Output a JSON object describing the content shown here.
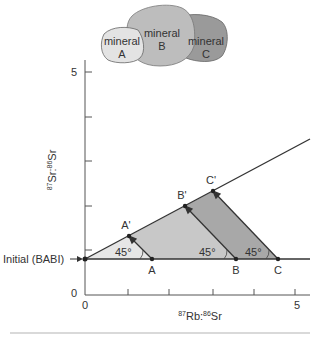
{
  "minerals": [
    {
      "name": "mineral",
      "id": "A",
      "fill": "#e3e3e3"
    },
    {
      "name": "mineral",
      "id": "B",
      "fill": "#bdbdbd"
    },
    {
      "name": "mineral",
      "id": "C",
      "fill": "#9a9a9a"
    }
  ],
  "axes": {
    "y_label_sup1": "87",
    "y_label_main1": "Sr:",
    "y_label_sup2": "86",
    "y_label_main2": "Sr",
    "x_label_sup1": "87",
    "x_label_main1": "Rb:",
    "x_label_sup2": "86",
    "x_label_main2": "Sr",
    "y_top_tick": "5",
    "y_zero": "0",
    "x_zero": "0",
    "x_right_tick": "5"
  },
  "annotations": {
    "initial": "Initial (BABI)",
    "angle": "45°",
    "points_initial": [
      "A",
      "B",
      "C"
    ],
    "points_evolved": [
      "A'",
      "B'",
      "C'"
    ]
  },
  "colors": {
    "triangle_a": "#e6e6e6",
    "triangle_b": "#c8c8c8",
    "triangle_c": "#a8a8a8",
    "line": "#333333",
    "rule": "#cccccc"
  }
}
